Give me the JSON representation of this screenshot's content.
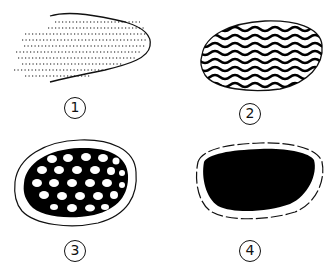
{
  "figure": {
    "panels": [
      {
        "id": 1,
        "label": "1",
        "pattern": "fine-dashes",
        "description": "sparse dashed stripes, partially enclosed outline"
      },
      {
        "id": 2,
        "label": "2",
        "pattern": "wavy-lines",
        "description": "wavy black bands inside outline"
      },
      {
        "id": 3,
        "label": "3",
        "pattern": "black-with-holes",
        "description": "mostly black with rows of white holes"
      },
      {
        "id": 4,
        "label": "4",
        "pattern": "solid-black",
        "description": "fully solid black fill"
      }
    ],
    "colors": {
      "ink": "#000000",
      "background": "#ffffff"
    }
  }
}
